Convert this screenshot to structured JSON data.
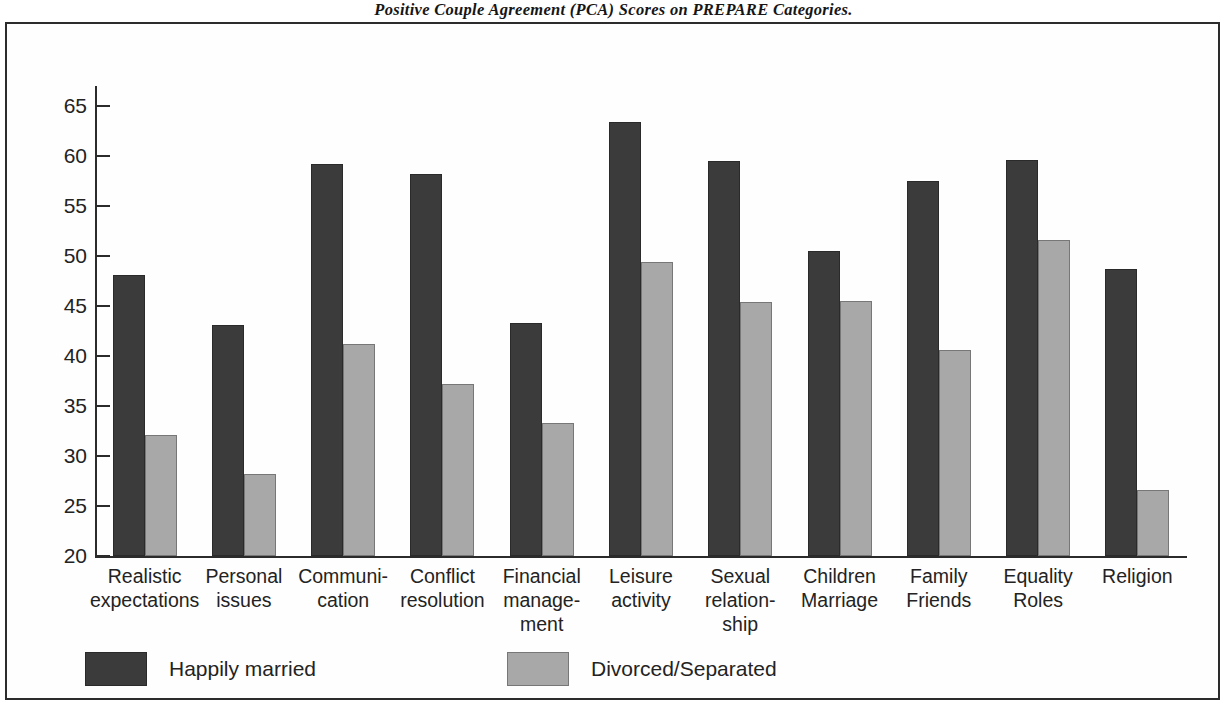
{
  "figure": {
    "title": "Positive Couple Agreement (PCA) Scores on PREPARE Categories."
  },
  "chart_data": {
    "type": "bar",
    "title": "Positive Couple Agreement (PCA) Scores on PREPARE Categories.",
    "xlabel": "",
    "ylabel": "",
    "ylim": [
      20,
      67
    ],
    "yticks": [
      20,
      25,
      30,
      35,
      40,
      45,
      50,
      55,
      60,
      65
    ],
    "grid": false,
    "legend_position": "bottom-left",
    "categories": [
      "Realistic expectations",
      "Personal issues",
      "Communi- cation",
      "Conflict resolution",
      "Financial manage- ment",
      "Leisure activity",
      "Sexual relation- ship",
      "Children Marriage",
      "Family Friends",
      "Equality Roles",
      "Religion"
    ],
    "series": [
      {
        "name": "Happily married",
        "color": "#3b3b3b",
        "values": [
          48.1,
          43.1,
          59.2,
          58.2,
          43.3,
          63.4,
          59.5,
          50.5,
          57.5,
          59.6,
          48.7
        ]
      },
      {
        "name": "Divorced/Separated",
        "color": "#a8a8a8",
        "values": [
          32.1,
          28.2,
          41.2,
          37.2,
          33.3,
          49.4,
          45.4,
          45.5,
          40.6,
          51.6,
          26.6
        ]
      }
    ]
  },
  "axis": {
    "tick_labels": [
      "65",
      "60",
      "55",
      "50",
      "45",
      "40",
      "35",
      "30",
      "25",
      "20"
    ]
  },
  "x_axis": {
    "labels": [
      "Realistic\nexpectations",
      "Personal\nissues",
      "Communi-\ncation",
      "Conflict\nresolution",
      "Financial\nmanage-\nment",
      "Leisure\nactivity",
      "Sexual\nrelation-\nship",
      "Children\nMarriage",
      "Family\nFriends",
      "Equality\nRoles",
      "Religion"
    ]
  },
  "legend": {
    "items": [
      {
        "label": "Happily married",
        "color": "#3b3b3b"
      },
      {
        "label": "Divorced/Separated",
        "color": "#a8a8a8"
      }
    ]
  }
}
